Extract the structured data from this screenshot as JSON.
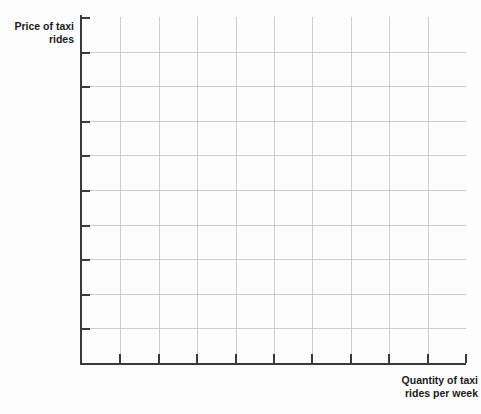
{
  "chart_data": {
    "type": "line",
    "title": "",
    "subtitle": "",
    "xlabel_line1": "Quantity of taxi",
    "xlabel_line2": "rides per week",
    "ylabel_line1": "Price of taxi",
    "ylabel_line2": "rides",
    "series": [],
    "categories": [],
    "values": [],
    "annotations": [],
    "legend": [],
    "legend_position": "none",
    "grid": true,
    "x_tick_count": 10,
    "y_tick_count": 10,
    "x_tick_labels": [],
    "y_tick_labels": [],
    "xlim": [
      0,
      10
    ],
    "ylim": [
      0,
      10
    ],
    "note": "Empty graph grid with labeled axes and no plotted data"
  },
  "axes": {
    "y_label_line1": "Price of taxi",
    "y_label_line2": "rides",
    "x_label_line1": "Quantity of taxi",
    "x_label_line2": "rides per week"
  },
  "artifacts": {
    "top_crop_text": ""
  },
  "colors": {
    "background": "#fdfdfd",
    "gridline": "#cdcdcd",
    "axis": "#3a3a3a",
    "label_text": "#1b1b1b"
  }
}
